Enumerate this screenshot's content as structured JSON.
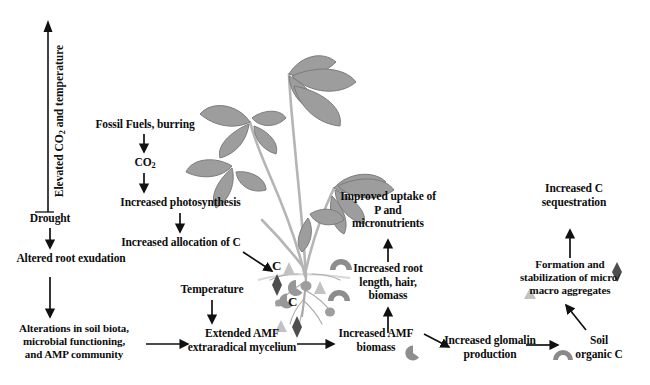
{
  "figure": {
    "domain": "diagram",
    "type": "conceptual-flow-diagram",
    "background_color": "#ffffff",
    "text_color": "#0d0d0d",
    "arrow_color": "#111111"
  },
  "axis": {
    "label_part1": "Elevated CO",
    "label_sub": "2",
    "label_part2": " and temperature",
    "direction": "up"
  },
  "nodes": {
    "fossil_fuels": "Fossil Fuels, burring",
    "co2": "CO",
    "co2_sub": "2",
    "increased_photosynthesis": "Increased photosynthesis",
    "increased_allocation": "Increased allocation of C",
    "drought": "Drought",
    "altered_root_exudation": "Altered root exudation",
    "alterations_soil_biota": "Alterations in soil biota,\nmicrobial functioning,\nand AMP community",
    "temperature": "Temperature",
    "extended_amf": "Extended AMF\nextraradical mycelium",
    "increased_amf_biomass": "Increased AMF\nbiomass",
    "increased_root_length": "Increased root\nlength, hair,\nbiomass",
    "improved_uptake": "Improved uptake of\nP and\nmicronutrients",
    "increased_glomalin": "Increased glomalin\nproduction",
    "soil_organic_c": "Soil\norganic C",
    "formation_stabilization": "Formation and\nstabilization of micro/\nmacro aggregates",
    "increased_c_sequestration": "Increased C\nsequestration"
  },
  "root_zone": {
    "carbon_labels": [
      "C",
      "C"
    ],
    "symbol_names": [
      "diamond-symbol",
      "crescent-symbol",
      "triangle-symbol",
      "root-arc-symbol"
    ],
    "diamond_color": "#4a4a4a",
    "crescent_color": "#9a9a9a",
    "triangle_color": "#bdbdbd",
    "arc_color": "#8d8d8d"
  },
  "inline_symbols": {
    "amf_biomass_crescent": "crescent-symbol",
    "soil_organic_arc": "root-arc-symbol",
    "aggregates_diamond": "diamond-symbol",
    "aggregates_triangle": "triangle-symbol"
  },
  "plant": {
    "name": "plant-illustration",
    "leaf_color": "#9b9b9b",
    "leaf_shade": "#7f7f7f",
    "stem_color": "#b9b9b9"
  }
}
